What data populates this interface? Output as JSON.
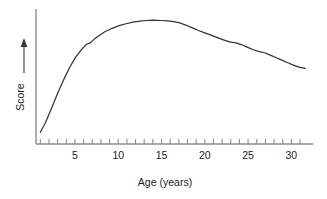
{
  "chart_data": {
    "type": "line",
    "title": "",
    "xlabel": "Age (years)",
    "ylabel": "Score",
    "xlim": [
      0.5,
      32.5
    ],
    "ylim": [
      0,
      100
    ],
    "grid": false,
    "legend": null,
    "x_tick_labels": [
      "5",
      "10",
      "15",
      "20",
      "25",
      "30"
    ],
    "x_tick_values": [
      5,
      10,
      15,
      20,
      25,
      30
    ],
    "x_minor_ticks": [
      1,
      2,
      3,
      4,
      5,
      6,
      7,
      8,
      9,
      10,
      11,
      12,
      13,
      14,
      15,
      16,
      17,
      18,
      19,
      20,
      21,
      22,
      23,
      24,
      25,
      26,
      27,
      28,
      29,
      30,
      31
    ],
    "y_tick_labels": [],
    "y_axis_arrow": true,
    "series": [
      {
        "name": "Score",
        "x": [
          1.0,
          1.6,
          2.3,
          3.0,
          3.7,
          4.4,
          5.1,
          5.8,
          6.3,
          6.8,
          7.2,
          7.8,
          8.5,
          9.3,
          10.1,
          10.9,
          11.7,
          12.5,
          13.3,
          14.1,
          14.9,
          15.7,
          16.4,
          17.1,
          17.8,
          18.5,
          19.2,
          20.0,
          20.8,
          21.6,
          22.4,
          23.0,
          23.6,
          24.2,
          24.9,
          25.6,
          26.3,
          26.9,
          27.5,
          28.2,
          28.9,
          29.6,
          30.3,
          31.0,
          31.6
        ],
        "y": [
          9.0,
          16.5,
          27.5,
          39.0,
          49.5,
          59.0,
          67.0,
          73.0,
          76.5,
          78.0,
          80.5,
          83.5,
          86.5,
          89.0,
          91.0,
          92.5,
          93.7,
          94.5,
          95.0,
          95.2,
          95.0,
          94.7,
          94.2,
          93.2,
          91.5,
          89.5,
          87.5,
          85.5,
          83.5,
          81.5,
          79.5,
          78.3,
          77.8,
          76.5,
          74.5,
          72.5,
          71.0,
          70.2,
          68.5,
          66.5,
          64.5,
          62.5,
          60.5,
          59.0,
          58.2
        ]
      }
    ],
    "line_color": "#333333",
    "axis_color": "#8c8c8c"
  },
  "axes": {
    "x_axis_label": "Age (years)",
    "y_axis_label": "Score"
  }
}
